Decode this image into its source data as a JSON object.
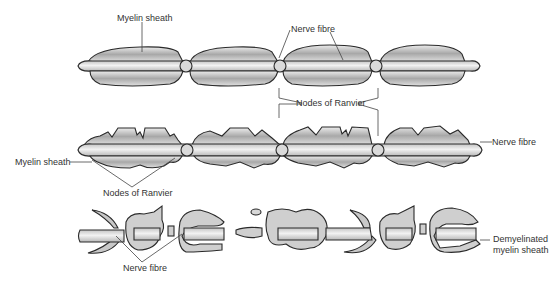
{
  "diagram": {
    "colors": {
      "outline": "#2a2a2a",
      "sheath_light": "#d8d8d8",
      "sheath_dark": "#a9a9a9",
      "fibre": "#e6e6e6",
      "fibre_shade": "#bdbdbd",
      "leader": "#444444",
      "text": "#333333"
    },
    "panel_1": {
      "labels": {
        "myelin_sheath": "Myelin sheath",
        "nerve_fibre": "Nerve fibre",
        "nodes_of_ranvier": "Nodes of Ranvier"
      }
    },
    "panel_2": {
      "labels": {
        "myelin_sheath": "Myelin sheath",
        "nerve_fibre": "Nerve fibre",
        "nodes_of_ranvier": "Nodes of Ranvier"
      }
    },
    "panel_3": {
      "labels": {
        "nerve_fibre": "Nerve fibre",
        "demyelinated_line1": "Demyelinated",
        "demyelinated_line2": "myelin sheath"
      }
    }
  }
}
